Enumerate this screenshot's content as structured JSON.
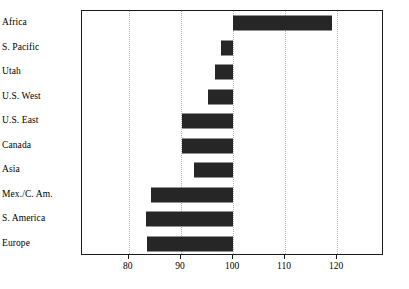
{
  "chart_data": {
    "type": "bar",
    "orientation": "horizontal",
    "title": "",
    "xlabel": "",
    "ylabel": "",
    "xlim": [
      71,
      129
    ],
    "xticks": [
      80,
      90,
      100,
      110,
      120
    ],
    "xtick_labels": [
      "80",
      "90",
      "100",
      "110",
      "120"
    ],
    "baseline": 100,
    "grid": true,
    "grid_axis": "x",
    "legend": "none",
    "bar_color": "#262626",
    "frame_color": "#1a1a1a",
    "grid_color": "#b4b4b4",
    "categories": [
      "Africa",
      "S. Pacific",
      "Utah",
      "U.S. West",
      "U.S. East",
      "Canada",
      "Asia",
      "Mex./C. Am.",
      "S. America",
      "Europe"
    ],
    "values": [
      119,
      97.7,
      96.5,
      95.2,
      90.2,
      90.2,
      92.5,
      84.3,
      83.2,
      83.5
    ]
  }
}
